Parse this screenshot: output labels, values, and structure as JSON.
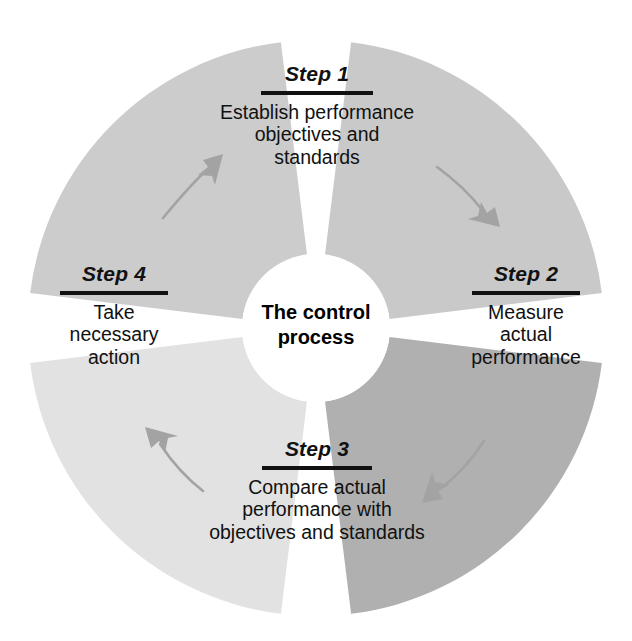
{
  "diagram": {
    "title": "The control process",
    "type": "cycle-wheel",
    "hub": {
      "label": "The control\nprocess",
      "fill": "#ffffff",
      "text_color": "#000000"
    },
    "geometry": {
      "center_x": 316,
      "center_y": 328,
      "outer_radius": 288,
      "inner_radius": 74,
      "gap_degrees": 14
    },
    "arrow_color": "#a3a3a3",
    "steps": [
      {
        "id": "step-1",
        "title": "Step 1",
        "body": "Establish performance\nobjectives and\nstandards",
        "fill": "#c9c9c9",
        "start_angle": -83,
        "end_angle": -7,
        "position": "top"
      },
      {
        "id": "step-2",
        "title": "Step 2",
        "body": "Measure\nactual\nperformance",
        "fill": "#b0b0b0",
        "start_angle": 7,
        "end_angle": 83,
        "position": "right"
      },
      {
        "id": "step-3",
        "title": "Step 3",
        "body": "Compare actual\nperformance with\nobjectives and standards",
        "fill": "#e2e2e2",
        "start_angle": 97,
        "end_angle": 173,
        "position": "bottom"
      },
      {
        "id": "step-4",
        "title": "Step 4",
        "body": "Take\nnecessary\naction",
        "fill": "#cccccc",
        "start_angle": 187,
        "end_angle": 263,
        "position": "left"
      }
    ],
    "arrows": [
      {
        "id": "arrow-1-to-2",
        "from": "step-1",
        "to": "step-2",
        "direction": "down-right"
      },
      {
        "id": "arrow-2-to-3",
        "from": "step-2",
        "to": "step-3",
        "direction": "down-left"
      },
      {
        "id": "arrow-3-to-4",
        "from": "step-3",
        "to": "step-4",
        "direction": "up-left"
      },
      {
        "id": "arrow-4-to-1",
        "from": "step-4",
        "to": "step-1",
        "direction": "up-right"
      }
    ]
  }
}
